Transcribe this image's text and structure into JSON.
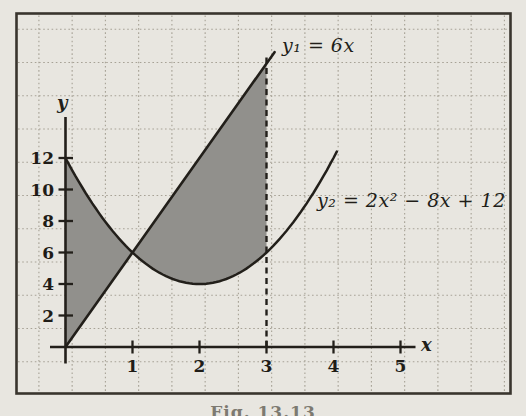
{
  "figure": {
    "caption": "Fig. 13.13"
  },
  "colors": {
    "paper": "#e8e6e0",
    "grid": "#a7a296",
    "ink": "#221f1a",
    "border": "#39352e",
    "shading": "#91908c"
  },
  "chart_data": {
    "type": "line",
    "title": "",
    "xlabel": "x",
    "ylabel": "y",
    "xlim": [
      0,
      5.6
    ],
    "ylim": [
      0,
      14.6
    ],
    "x_ticks": [
      1,
      2,
      3,
      4,
      5
    ],
    "y_ticks": [
      2,
      4,
      6,
      8,
      10,
      12
    ],
    "grid": true,
    "legend_position": "inline-labels",
    "series": [
      {
        "name": "y₁ = 6x",
        "curve": "linear",
        "slope": 6,
        "intercept": 0,
        "x_range": [
          0,
          3.12
        ],
        "points": [
          [
            0,
            0
          ],
          [
            1,
            6
          ],
          [
            2,
            12
          ],
          [
            3,
            18
          ]
        ]
      },
      {
        "name": "y₂ = 2x² − 8x + 12",
        "curve": "quadratic",
        "a": 2,
        "b": -8,
        "c": 12,
        "x_range": [
          0,
          4.05
        ],
        "points": [
          [
            0,
            12
          ],
          [
            1,
            6
          ],
          [
            2,
            4
          ],
          [
            3,
            6
          ],
          [
            4,
            12
          ]
        ]
      }
    ],
    "annotations": {
      "dashed_vertical_line_x": 3,
      "intersection_point": [
        1,
        6
      ],
      "shaded_region": "area between y1 and y2 from x = 0 to x = 3"
    }
  }
}
